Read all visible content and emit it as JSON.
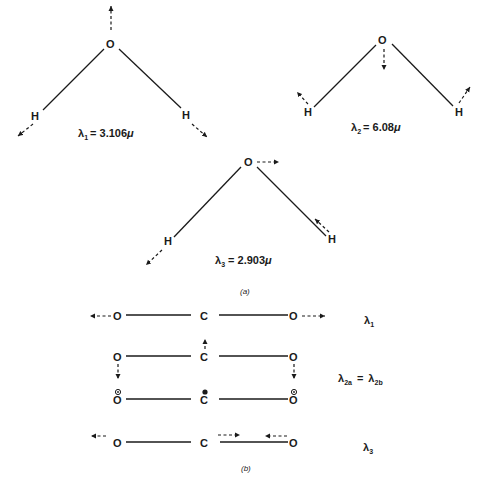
{
  "figure": {
    "panel_a": {
      "caption": "(a)",
      "molecules": [
        {
          "name": "water-mode-1",
          "atoms": {
            "center": "O",
            "left": "H",
            "right": "H"
          },
          "label_symbol": "λ",
          "label_subscript": "1",
          "label_value": "= 3.106",
          "label_unit": "μ",
          "motion": "symmetric stretch"
        },
        {
          "name": "water-mode-2",
          "atoms": {
            "center": "O",
            "left": "H",
            "right": "H"
          },
          "label_symbol": "λ",
          "label_subscript": "2",
          "label_value": "= 6.08",
          "label_unit": "μ",
          "motion": "bending"
        },
        {
          "name": "water-mode-3",
          "atoms": {
            "center": "O",
            "left": "H",
            "right": "H"
          },
          "label_symbol": "λ",
          "label_subscript": "3",
          "label_value": "= 2.903",
          "label_unit": "μ",
          "motion": "asymmetric stretch"
        }
      ]
    },
    "panel_b": {
      "caption": "(b)",
      "rows": [
        {
          "left": "O",
          "center": "C",
          "right": "O",
          "label_symbol": "λ",
          "label_subscript": "1"
        },
        {
          "left": "O",
          "center": "C",
          "right": "O"
        },
        {
          "left": "O",
          "center": "C",
          "right": "O"
        },
        {
          "left": "O",
          "center": "C",
          "right": "O",
          "label_symbol": "λ",
          "label_subscript": "3"
        }
      ],
      "bending_label": {
        "symbol_a": "λ",
        "sub_a": "2a",
        "equals": "=",
        "symbol_b": "λ",
        "sub_b": "2b"
      }
    },
    "colors": {
      "ink": "#1a1a1a",
      "background": "#ffffff"
    }
  }
}
